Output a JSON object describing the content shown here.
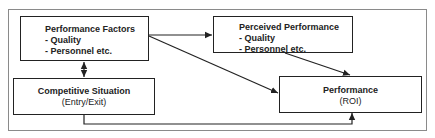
{
  "diagram": {
    "nodes": [
      {
        "id": "performance_factors",
        "title": "Performance Factors",
        "items": [
          "- Quality",
          "- Personnel etc."
        ]
      },
      {
        "id": "perceived_performance",
        "title": "Perceived Performance",
        "items": [
          "- Quality",
          "- Personnel etc."
        ]
      },
      {
        "id": "competitive_situation",
        "title": "Competitive Situation",
        "subtitle": "(Entry/Exit)"
      },
      {
        "id": "performance_roi",
        "title": "Performance",
        "subtitle": "(ROI)"
      }
    ],
    "edges": [
      {
        "from": "performance_factors",
        "to": "perceived_performance"
      },
      {
        "from": "performance_factors",
        "to": "performance_roi"
      },
      {
        "from": "perceived_performance",
        "to": "performance_roi"
      },
      {
        "from": "performance_factors",
        "to": "competitive_situation",
        "bidirectional": true
      },
      {
        "from": "competitive_situation",
        "to": "performance_roi"
      }
    ],
    "colors": {
      "stroke": "#222222",
      "frame": "#8a8a8a",
      "background": "#ffffff"
    }
  }
}
